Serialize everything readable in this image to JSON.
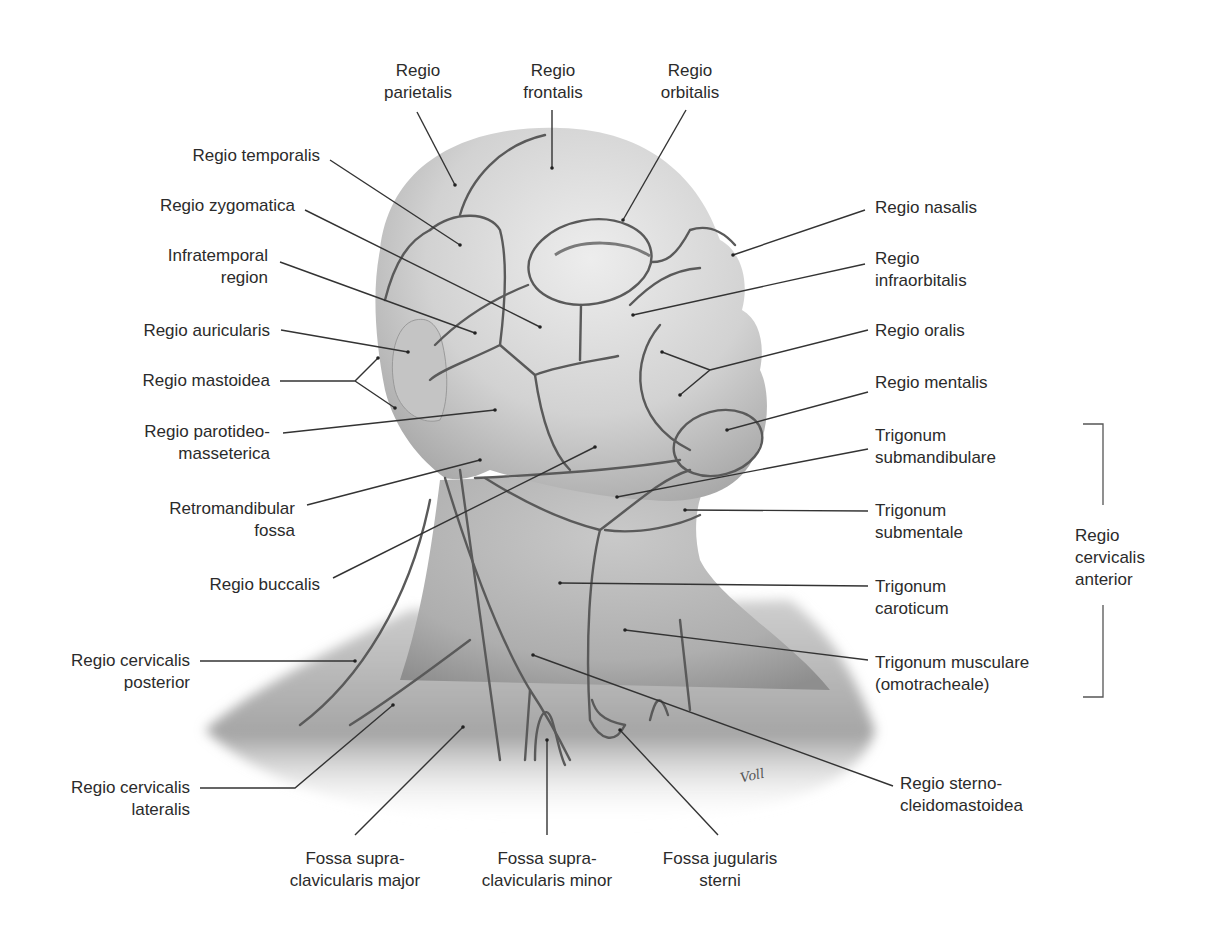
{
  "figure": {
    "signature": "Voll"
  },
  "labels": {
    "parietalis": "Regio\nparietalis",
    "frontalis": "Regio\nfrontalis",
    "orbitalis": "Regio\norbitalis",
    "temporalis": "Regio temporalis",
    "zygomatica": "Regio zygomatica",
    "infratemporal": "Infratemporal\nregion",
    "auricularis": "Regio auricularis",
    "mastoidea": "Regio mastoidea",
    "parotideo": "Regio parotideo-\nmasseterica",
    "retromandibular": "Retromandibular\nfossa",
    "buccalis": "Regio buccalis",
    "cervicalis_posterior": "Regio cervicalis\nposterior",
    "cervicalis_lateralis": "Regio cervicalis\nlateralis",
    "fossa_major": "Fossa supra-\nclavicularis major",
    "fossa_minor": "Fossa supra-\nclavicularis minor",
    "fossa_jugularis": "Fossa jugularis\nsterni",
    "sternocleido": "Regio sterno-\ncleidomastoidea",
    "nasalis": "Regio nasalis",
    "infraorbitalis": "Regio\ninfraorbitalis",
    "oralis": "Regio oralis",
    "mentalis": "Regio mentalis",
    "submandibulare": "Trigonum\nsubmandibulare",
    "submentale": "Trigonum\nsubmentale",
    "caroticum": "Trigonum\ncaroticum",
    "musculare": "Trigonum musculare\n(omotracheale)",
    "cervicalis_anterior": "Regio\ncervicalis\nanterior"
  },
  "colors": {
    "background": "#ffffff",
    "skin_light": "#e6e6e6",
    "skin_mid": "#bdbdbd",
    "skin_dark": "#8f8f8f",
    "region_line": "#555555",
    "leader_line": "#333333",
    "text": "#2b2b2b"
  }
}
